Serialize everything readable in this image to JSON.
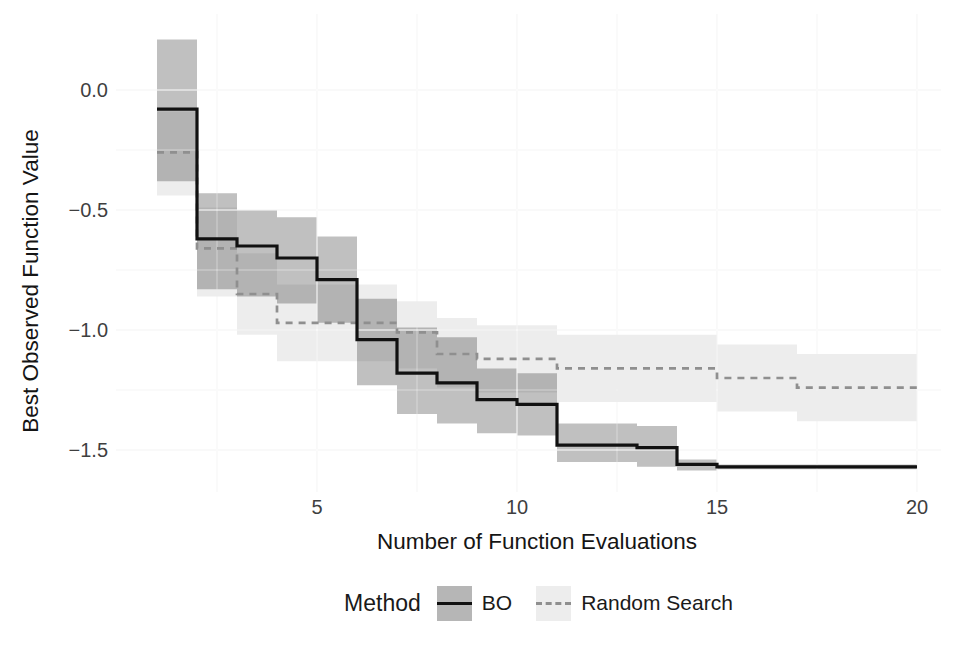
{
  "chart_data": {
    "type": "line",
    "variant": "step-function-with-confidence-ribbons",
    "title": "",
    "xlabel": "Number of Function Evaluations",
    "ylabel": "Best Observed Function Value",
    "legend_title": "Method",
    "legend_position": "bottom-center",
    "grid": "very faint major and minor gridlines, no axis lines, no tick marks",
    "xlim": [
      1,
      20
    ],
    "ylim": [
      -1.66,
      0.3
    ],
    "x_ticks": [
      5,
      10,
      15,
      20
    ],
    "x_tick_labels": [
      "5",
      "10",
      "15",
      "20"
    ],
    "y_ticks": [
      0,
      -0.5,
      -1.0,
      -1.5
    ],
    "y_tick_labels": [
      "0.0",
      "−0.5",
      "−1.0",
      "−1.5"
    ],
    "x": [
      1,
      2,
      3,
      4,
      5,
      6,
      7,
      8,
      9,
      10,
      11,
      12,
      13,
      14,
      15,
      16,
      17,
      18,
      19,
      20
    ],
    "series": [
      {
        "name": "BO",
        "line_style": "solid",
        "line_color": "#111111",
        "line_width": 3.2,
        "ribbon_color": "rgba(45,45,45,0.30)",
        "legend_key_fill": "#b6b6b6",
        "values": [
          -0.08,
          -0.62,
          -0.65,
          -0.7,
          -0.79,
          -1.04,
          -1.18,
          -1.22,
          -1.29,
          -1.31,
          -1.48,
          -1.48,
          -1.49,
          -1.56,
          -1.57,
          -1.57,
          -1.57,
          -1.57,
          -1.57,
          -1.57
        ],
        "ribbon_upper": [
          0.21,
          -0.43,
          -0.5,
          -0.53,
          -0.61,
          -0.87,
          -0.99,
          -1.03,
          -1.16,
          -1.18,
          -1.39,
          -1.39,
          -1.4,
          -1.54,
          -1.56,
          -1.56,
          -1.56,
          -1.56,
          -1.56,
          -1.56
        ],
        "ribbon_lower": [
          -0.38,
          -0.83,
          -0.86,
          -0.89,
          -0.97,
          -1.23,
          -1.35,
          -1.39,
          -1.43,
          -1.44,
          -1.55,
          -1.55,
          -1.57,
          -1.585,
          -1.58,
          -1.58,
          -1.58,
          -1.58,
          -1.58,
          -1.58
        ]
      },
      {
        "name": "Random Search",
        "line_style": "dashed",
        "line_color": "#8f8f8f",
        "line_width": 2.7,
        "ribbon_color": "rgba(45,45,45,0.085)",
        "legend_key_fill": "#ededed",
        "values": [
          -0.26,
          -0.66,
          -0.85,
          -0.97,
          -0.97,
          -0.97,
          -1.01,
          -1.1,
          -1.12,
          -1.12,
          -1.16,
          -1.16,
          -1.16,
          -1.16,
          -1.2,
          -1.2,
          -1.24,
          -1.24,
          -1.24,
          -1.24
        ],
        "ribbon_upper": [
          -0.09,
          -0.49,
          -0.68,
          -0.81,
          -0.81,
          -0.81,
          -0.88,
          -0.95,
          -0.98,
          -0.98,
          -1.02,
          -1.02,
          -1.02,
          -1.02,
          -1.06,
          -1.06,
          -1.1,
          -1.1,
          -1.1,
          -1.1
        ],
        "ribbon_lower": [
          -0.44,
          -0.86,
          -1.02,
          -1.13,
          -1.13,
          -1.13,
          -1.16,
          -1.24,
          -1.26,
          -1.26,
          -1.3,
          -1.3,
          -1.3,
          -1.3,
          -1.34,
          -1.34,
          -1.38,
          -1.38,
          -1.38,
          -1.38
        ]
      }
    ]
  }
}
